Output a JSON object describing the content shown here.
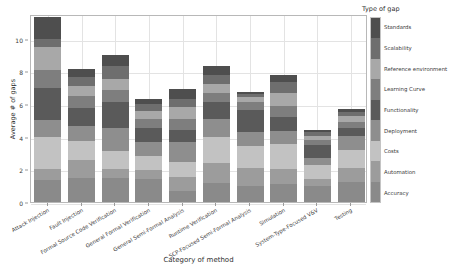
{
  "chart_data": {
    "type": "bar",
    "subtype": "stacked-bar",
    "title": "",
    "xlabel": "Category of method",
    "ylabel": "Average # of gaps",
    "ylim": [
      0,
      11.5
    ],
    "yticks": [
      0,
      2,
      4,
      6,
      8,
      10
    ],
    "ytick_labels": [
      "0",
      "2",
      "4",
      "6",
      "8",
      "10"
    ],
    "grid": true,
    "legend_title": "Type of gap",
    "legend_position": "right-colorbar",
    "categories": [
      "Attack Injection",
      "Fault Injection",
      "Formal Source Code Verification",
      "General Formal Verification",
      "General Semi-Formal Analysis",
      "Runtime Verification",
      "SCP-Focused Semi-Formal Analysis",
      "Simulation",
      "System-Type-Focused V&V",
      "Testing"
    ],
    "totals": [
      11.3,
      8.15,
      9.0,
      6.3,
      6.9,
      8.3,
      6.75,
      7.75,
      4.4,
      5.7
    ],
    "series": [
      {
        "name": "Accuracy",
        "color": "#8a8a8a",
        "values": [
          1.35,
          1.45,
          1.45,
          1.4,
          0.65,
          1.15,
          0.95,
          1.1,
          0.95,
          1.2
        ]
      },
      {
        "name": "Automation",
        "color": "#9c9c9c",
        "values": [
          0.65,
          1.1,
          0.6,
          0.55,
          0.85,
          1.25,
          1.15,
          0.9,
          0.45,
          0.9
        ]
      },
      {
        "name": "Costs",
        "color": "#c2c2c2",
        "values": [
          2.0,
          1.2,
          1.05,
          0.85,
          0.95,
          1.6,
          1.3,
          1.55,
          0.85,
          1.1
        ]
      },
      {
        "name": "Deployment",
        "color": "#8e8e8e",
        "values": [
          1.0,
          0.9,
          1.45,
          0.9,
          1.25,
          1.05,
          0.9,
          0.8,
          0.45,
          0.85
        ]
      },
      {
        "name": "Functionality",
        "color": "#5a5a5a",
        "values": [
          2.0,
          1.1,
          1.55,
          0.85,
          0.7,
          1.1,
          1.3,
          0.85,
          0.8,
          0.5
        ]
      },
      {
        "name": "Learning Curve",
        "color": "#7e7e7e",
        "values": [
          1.1,
          0.75,
          0.75,
          0.5,
          0.65,
          0.55,
          0.5,
          0.65,
          0.3,
          0.35
        ]
      },
      {
        "name": "Reference environment",
        "color": "#a8a8a8",
        "values": [
          1.4,
          0.6,
          0.65,
          0.55,
          0.75,
          0.5,
          0.3,
          0.85,
          0.25,
          0.35
        ]
      },
      {
        "name": "Scalability",
        "color": "#6e6e6e",
        "values": [
          0.5,
          0.55,
          0.8,
          0.4,
          0.5,
          0.6,
          0.2,
          0.65,
          0.25,
          0.25
        ]
      },
      {
        "name": "Standards",
        "color": "#4e4e4e",
        "values": [
          1.3,
          0.5,
          0.7,
          0.3,
          0.6,
          0.5,
          0.15,
          0.4,
          0.1,
          0.2
        ]
      }
    ],
    "legend_entries": [
      {
        "label": "Standards",
        "color": "#4e4e4e"
      },
      {
        "label": "Scalability",
        "color": "#6e6e6e"
      },
      {
        "label": "Reference environment",
        "color": "#a8a8a8"
      },
      {
        "label": "Learning Curve",
        "color": "#7e7e7e"
      },
      {
        "label": "Functionality",
        "color": "#5a5a5a"
      },
      {
        "label": "Deployment",
        "color": "#8e8e8e"
      },
      {
        "label": "Costs",
        "color": "#c2c2c2"
      },
      {
        "label": "Automation",
        "color": "#9c9c9c"
      },
      {
        "label": "Accuracy",
        "color": "#8a8a8a"
      }
    ]
  }
}
